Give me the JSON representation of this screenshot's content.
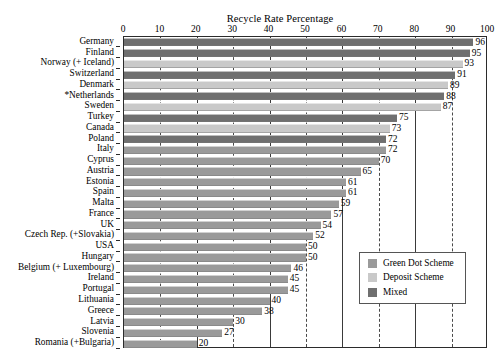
{
  "chart_data": {
    "type": "bar",
    "orientation": "horizontal",
    "title": "Recycle Rate Percentage",
    "xlabel": "",
    "ylabel": "",
    "xlim": [
      0,
      100
    ],
    "xticks": [
      0,
      10,
      20,
      30,
      40,
      50,
      60,
      70,
      80,
      90,
      100
    ],
    "grid": true,
    "legend_position": "bottom-right",
    "legend": [
      {
        "label": "Green Dot Scheme",
        "color": "#9a9a9a",
        "key": "green-dot"
      },
      {
        "label": "Deposit Scheme",
        "color": "#c9c9c9",
        "key": "deposit"
      },
      {
        "label": "Mixed",
        "color": "#6f6f6f",
        "key": "mixed"
      }
    ],
    "categories": [
      "Germany",
      "Finland",
      "Norway (+ Iceland)",
      "Switzerland",
      "Denmark",
      "*Netherlands",
      "Sweden",
      "Turkey",
      "Canada",
      "Poland",
      "Italy",
      "Cyprus",
      "Austria",
      "Estonia",
      "Spain",
      "Malta",
      "France",
      "UK",
      "Czech Rep. (+Slovakia)",
      "USA",
      "Hungary",
      "Belgium (+ Luxembourg)",
      "Ireland",
      "Portugal",
      "Lithuania",
      "Greece",
      "Latvia",
      "Slovenia",
      "Romania (+Bulgaria)"
    ],
    "values": [
      96,
      95,
      93,
      91,
      89,
      88,
      87,
      75,
      73,
      72,
      72,
      70,
      65,
      61,
      61,
      59,
      57,
      54,
      52,
      50,
      50,
      46,
      45,
      45,
      40,
      38,
      30,
      27,
      20
    ],
    "scheme": [
      "mixed",
      "mixed",
      "deposit",
      "mixed",
      "deposit",
      "mixed",
      "deposit",
      "mixed",
      "deposit",
      "mixed",
      "green-dot",
      "green-dot",
      "green-dot",
      "green-dot",
      "green-dot",
      "green-dot",
      "green-dot",
      "green-dot",
      "green-dot",
      "green-dot",
      "green-dot",
      "green-dot",
      "green-dot",
      "green-dot",
      "green-dot",
      "green-dot",
      "green-dot",
      "green-dot",
      "green-dot"
    ]
  }
}
